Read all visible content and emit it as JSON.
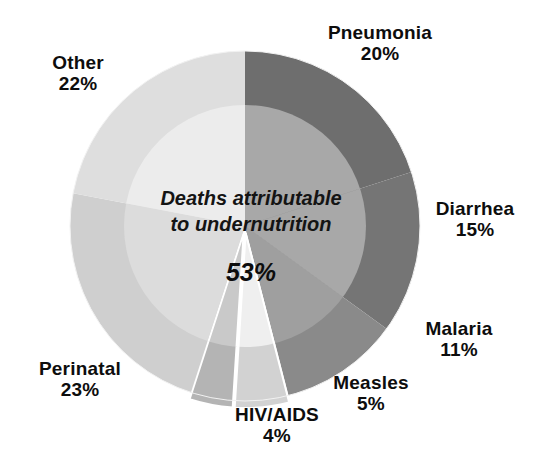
{
  "chart_data": {
    "type": "pie",
    "title": "",
    "subtitle": "",
    "xlabel": "",
    "ylabel": "",
    "legend_position": "outside-labels",
    "grid": false,
    "start_angle_deg": 0,
    "direction": "clockwise",
    "categories": [
      "Pneumonia",
      "Diarrhea",
      "Malaria",
      "Measles",
      "HIV/AIDS",
      "Perinatal",
      "Other"
    ],
    "values": [
      20,
      15,
      11,
      5,
      4,
      23,
      22
    ],
    "unit": "%",
    "slices": [
      {
        "label": "Pneumonia",
        "value": 20,
        "value_text": "20%",
        "color": "#6e6e6e",
        "exploded": false
      },
      {
        "label": "Diarrhea",
        "value": 15,
        "value_text": "15%",
        "color": "#757575",
        "exploded": false
      },
      {
        "label": "Malaria",
        "value": 11,
        "value_text": "11%",
        "color": "#8a8a8a",
        "exploded": false
      },
      {
        "label": "Measles",
        "value": 5,
        "value_text": "5%",
        "color": "#d2d2d2",
        "exploded": true
      },
      {
        "label": "HIV/AIDS",
        "value": 4,
        "value_text": "4%",
        "color": "#b4b4b4",
        "exploded": true
      },
      {
        "label": "Perinatal",
        "value": 23,
        "value_text": "23%",
        "color": "#cfcfcf",
        "exploded": false
      },
      {
        "label": "Other",
        "value": 22,
        "value_text": "22%",
        "color": "#dedede",
        "exploded": false
      }
    ],
    "inner_overlay": {
      "note": "Deaths attributable\nto undernutrition",
      "value": 53,
      "value_text": "53%",
      "description": "Inner circle overlays the pie showing the share of deaths attributable to undernutrition"
    }
  },
  "labels": {
    "other": {
      "name": "Other",
      "pct": "22%"
    },
    "pneumonia": {
      "name": "Pneumonia",
      "pct": "20%"
    },
    "diarrhea": {
      "name": "Diarrhea",
      "pct": "15%"
    },
    "malaria": {
      "name": "Malaria",
      "pct": "11%"
    },
    "measles": {
      "name": "Measles",
      "pct": "5%"
    },
    "hivaids": {
      "name": "HIV/AIDS",
      "pct": "4%"
    },
    "perinatal": {
      "name": "Perinatal",
      "pct": "23%"
    }
  },
  "center": {
    "note": "Deaths attributable\nto undernutrition",
    "pct": "53%"
  },
  "colors": {
    "background": "#ffffff",
    "text": "#0d0d0d",
    "pneumonia": "#6e6e6e",
    "diarrhea": "#757575",
    "malaria": "#8a8a8a",
    "measles": "#d2d2d2",
    "hivaids": "#b4b4b4",
    "perinatal": "#cfcfcf",
    "other": "#dedede",
    "inner_light": "#ececec",
    "inner_mid": "#a8a8a8",
    "inner_dark": "#9a9a9a"
  }
}
